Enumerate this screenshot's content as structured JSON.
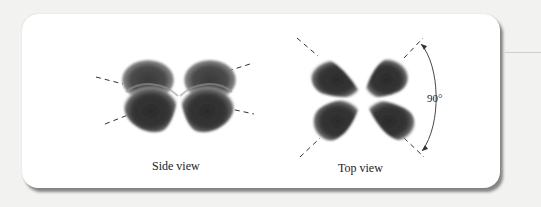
{
  "figure": {
    "panels": [
      {
        "id": "side",
        "caption": "Side view"
      },
      {
        "id": "top",
        "caption": "Top view"
      }
    ],
    "angle_label": "90°",
    "colors": {
      "lobe": "#2a2a2a",
      "panel": "#ffffff",
      "background": "#f2f2f0",
      "axis": "#333333"
    }
  }
}
